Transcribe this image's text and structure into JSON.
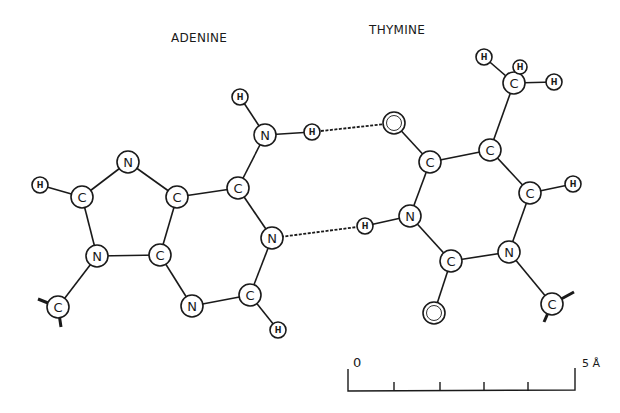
{
  "titles": {
    "adenine": "ADENINE",
    "thymine": "THYMINE"
  },
  "atoms": [
    {
      "id": "a_h_amino_top",
      "el": "H",
      "x": 240,
      "y": 97,
      "r": 8
    },
    {
      "id": "a_n6",
      "el": "N",
      "x": 265,
      "y": 135,
      "r": 11
    },
    {
      "id": "a_h_amino_bond",
      "el": "H",
      "x": 312,
      "y": 132,
      "r": 8
    },
    {
      "id": "a_c6",
      "el": "C",
      "x": 238,
      "y": 188,
      "r": 11
    },
    {
      "id": "a_n1",
      "el": "N",
      "x": 272,
      "y": 238,
      "r": 11
    },
    {
      "id": "a_c2",
      "el": "C",
      "x": 250,
      "y": 295,
      "r": 11
    },
    {
      "id": "a_h2",
      "el": "H",
      "x": 278,
      "y": 330,
      "r": 8
    },
    {
      "id": "a_n3",
      "el": "N",
      "x": 192,
      "y": 306,
      "r": 11
    },
    {
      "id": "a_c4",
      "el": "C",
      "x": 160,
      "y": 255,
      "r": 11
    },
    {
      "id": "a_c5",
      "el": "C",
      "x": 177,
      "y": 197,
      "r": 11
    },
    {
      "id": "a_n7",
      "el": "N",
      "x": 128,
      "y": 162,
      "r": 11
    },
    {
      "id": "a_c8",
      "el": "C",
      "x": 82,
      "y": 197,
      "r": 11
    },
    {
      "id": "a_h8",
      "el": "H",
      "x": 40,
      "y": 185,
      "r": 8
    },
    {
      "id": "a_n9",
      "el": "N",
      "x": 97,
      "y": 256,
      "r": 11
    },
    {
      "id": "a_c1s",
      "el": "C",
      "x": 58,
      "y": 307,
      "r": 11
    },
    {
      "id": "t_o4",
      "el": "O",
      "x": 394,
      "y": 123,
      "r": 11,
      "double": true
    },
    {
      "id": "t_c4",
      "el": "C",
      "x": 430,
      "y": 162,
      "r": 11
    },
    {
      "id": "t_c5",
      "el": "C",
      "x": 490,
      "y": 150,
      "r": 11
    },
    {
      "id": "t_cm",
      "el": "C",
      "x": 514,
      "y": 83,
      "r": 11
    },
    {
      "id": "t_hm1",
      "el": "H",
      "x": 484,
      "y": 57,
      "r": 8
    },
    {
      "id": "t_hm2",
      "el": "H",
      "x": 520,
      "y": 67,
      "r": 7
    },
    {
      "id": "t_hm3",
      "el": "H",
      "x": 554,
      "y": 82,
      "r": 8
    },
    {
      "id": "t_c6",
      "el": "C",
      "x": 530,
      "y": 193,
      "r": 11
    },
    {
      "id": "t_h6",
      "el": "H",
      "x": 573,
      "y": 184,
      "r": 8
    },
    {
      "id": "t_n1",
      "el": "N",
      "x": 509,
      "y": 252,
      "r": 11
    },
    {
      "id": "t_c1s",
      "el": "C",
      "x": 552,
      "y": 304,
      "r": 11
    },
    {
      "id": "t_c2",
      "el": "C",
      "x": 451,
      "y": 261,
      "r": 11
    },
    {
      "id": "t_o2",
      "el": "O",
      "x": 434,
      "y": 313,
      "r": 11,
      "double": true
    },
    {
      "id": "t_n3",
      "el": "N",
      "x": 410,
      "y": 216,
      "r": 11
    },
    {
      "id": "t_h3",
      "el": "H",
      "x": 365,
      "y": 226,
      "r": 8
    }
  ],
  "bonds": [
    [
      "a_h_amino_top",
      "a_n6"
    ],
    [
      "a_n6",
      "a_h_amino_bond"
    ],
    [
      "a_n6",
      "a_c6"
    ],
    [
      "a_c6",
      "a_n1"
    ],
    [
      "a_n1",
      "a_c2"
    ],
    [
      "a_c2",
      "a_h2"
    ],
    [
      "a_c2",
      "a_n3"
    ],
    [
      "a_n3",
      "a_c4"
    ],
    [
      "a_c4",
      "a_c5"
    ],
    [
      "a_c5",
      "a_c6"
    ],
    [
      "a_c5",
      "a_n7"
    ],
    [
      "a_n7",
      "a_c8"
    ],
    [
      "a_c8",
      "a_h8"
    ],
    [
      "a_c8",
      "a_n9"
    ],
    [
      "a_n9",
      "a_c4"
    ],
    [
      "a_n9",
      "a_c1s"
    ],
    [
      "t_o4",
      "t_c4"
    ],
    [
      "t_c4",
      "t_c5"
    ],
    [
      "t_c5",
      "t_cm"
    ],
    [
      "t_cm",
      "t_hm1"
    ],
    [
      "t_cm",
      "t_hm3"
    ],
    [
      "t_c5",
      "t_c6"
    ],
    [
      "t_c6",
      "t_h6"
    ],
    [
      "t_c6",
      "t_n1"
    ],
    [
      "t_n1",
      "t_c1s"
    ],
    [
      "t_n1",
      "t_c2"
    ],
    [
      "t_c2",
      "t_o2"
    ],
    [
      "t_c2",
      "t_n3"
    ],
    [
      "t_n3",
      "t_c4"
    ],
    [
      "t_n3",
      "t_h3"
    ]
  ],
  "hydrogen_bonds": [
    [
      "a_h_amino_bond",
      "t_o4"
    ],
    [
      "a_n1",
      "t_h3"
    ]
  ],
  "stubs": [
    {
      "from": "a_c1s",
      "dx": -20,
      "dy": -8
    },
    {
      "from": "a_c1s",
      "dx": 3,
      "dy": 20
    },
    {
      "from": "t_c1s",
      "dx": 22,
      "dy": -12
    },
    {
      "from": "t_c1s",
      "dx": -8,
      "dy": 18
    }
  ],
  "scale_bar": {
    "start_label": "0",
    "end_label": "5 Å",
    "x_start": 348,
    "x_end": 575,
    "y": 391,
    "ticks": [
      394,
      440,
      484,
      528
    ]
  }
}
